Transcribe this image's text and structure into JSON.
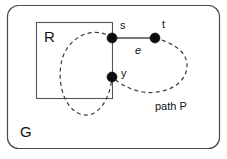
{
  "figure": {
    "type": "graph-diagram",
    "outer_region": {
      "name": "G",
      "label": "G",
      "shape": "rounded-rectangle"
    },
    "inner_region": {
      "name": "R",
      "label": "R",
      "shape": "rectangle"
    },
    "nodes": [
      {
        "id": "s",
        "label": "s",
        "x": 112,
        "y": 38
      },
      {
        "id": "t",
        "label": "t",
        "x": 155,
        "y": 38
      },
      {
        "id": "y",
        "label": "y",
        "x": 112,
        "y": 77
      }
    ],
    "edges": [
      {
        "id": "e",
        "label": "e",
        "from": "s",
        "to": "t",
        "style": "solid"
      }
    ],
    "path": {
      "id": "P",
      "label": "path P",
      "style": "dashed"
    },
    "colors": {
      "background": "#ffffff",
      "node_fill": "#0d0d0d",
      "line": "#4a4a4a",
      "dashed_line": "#3a3a3a",
      "text": "#111111"
    }
  }
}
